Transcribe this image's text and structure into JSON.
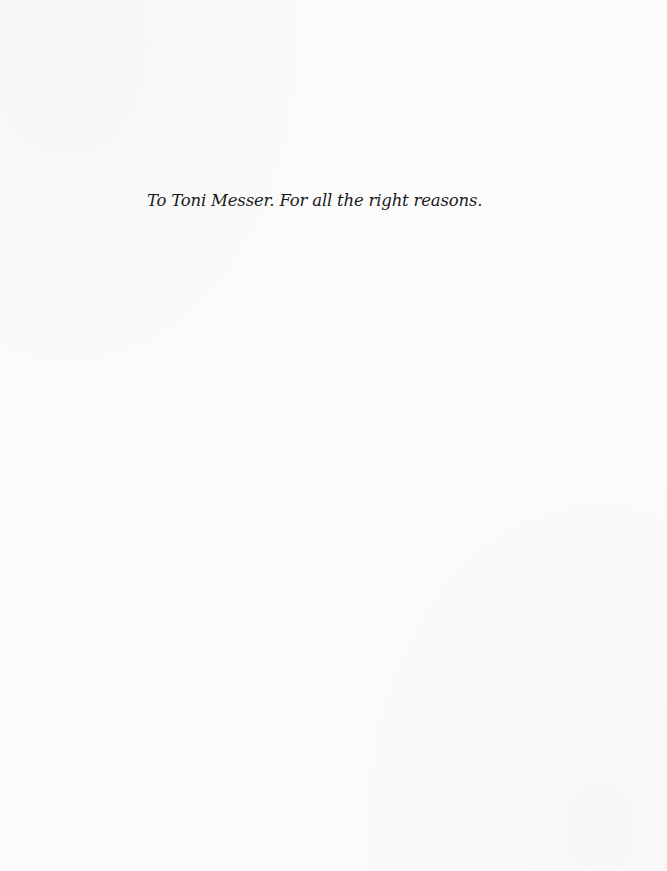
{
  "page": {
    "background_color": "#fcfcfc",
    "text_color": "#1a1a1a"
  },
  "dedication": {
    "text": "To Toni Messer. For all the right reasons."
  }
}
